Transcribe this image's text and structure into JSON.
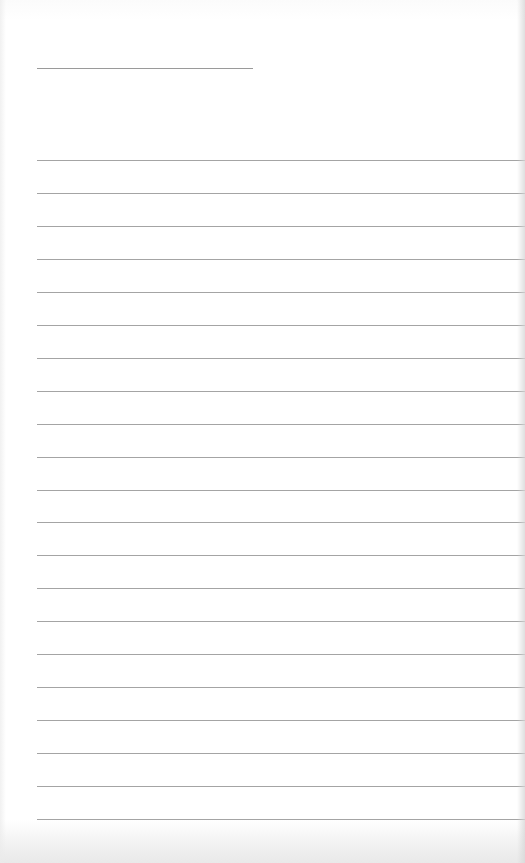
{
  "paper": {
    "background": "#ffffff",
    "line_color": "#a4a4a4",
    "title_line": {
      "x": 37,
      "y": 68,
      "width": 216
    },
    "ruled_lines": {
      "x": 37,
      "first_y": 160,
      "spacing": 32.95,
      "count": 21,
      "right_extent": 525
    },
    "text": ""
  }
}
